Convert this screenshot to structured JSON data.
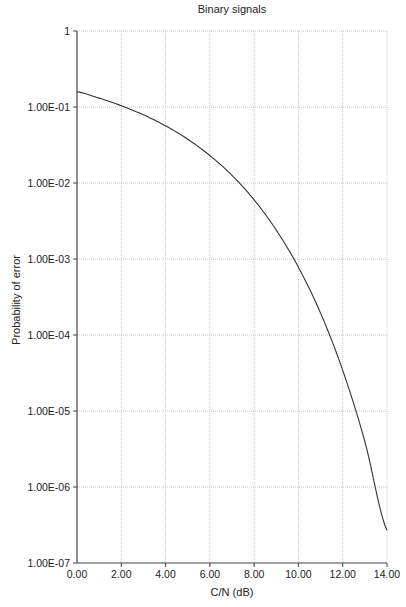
{
  "chart_data": {
    "type": "line",
    "title": "Binary signals",
    "xlabel": "C/N (dB)",
    "ylabel": "Probability of error",
    "yscale": "log",
    "xlim": [
      0,
      14
    ],
    "ylim": [
      1e-07,
      1
    ],
    "grid": true,
    "legend": null,
    "x_tick_labels": [
      "0.00",
      "2.00",
      "4.00",
      "6.00",
      "8.00",
      "10.00",
      "12.00",
      "14.00"
    ],
    "y_tick_labels": [
      "1",
      "1.00E-01",
      "1.00E-02",
      "1.00E-03",
      "1.00E-04",
      "1.00E-05",
      "1.00E-06",
      "1.00E-07"
    ],
    "x": [
      0,
      1,
      2,
      3,
      4,
      5,
      6,
      7,
      8,
      9,
      10,
      11,
      12,
      13,
      14
    ],
    "series": [
      {
        "name": "Pe",
        "values": [
          0.1587,
          0.1309,
          0.104,
          0.0789,
          0.0565,
          0.0377,
          0.023,
          0.0126,
          0.006,
          0.0024,
          0.00078,
          0.000194,
          3.43e-05,
          3.97e-06,
          2.69e-07
        ]
      }
    ]
  },
  "style": {
    "line_color": "#333333",
    "grid_color": "#c8c8c8",
    "axis_color": "#444444"
  }
}
